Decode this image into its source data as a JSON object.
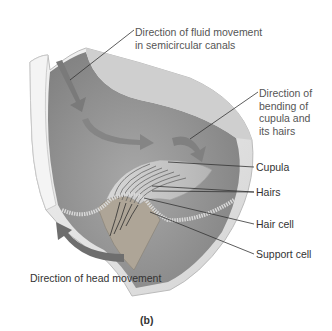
{
  "figure": {
    "subfigure_label": "(b)",
    "colors": {
      "canal_wall": "#e4e4e4",
      "canal_inner": "#8e8e8e",
      "arrow": "#7a7a7a",
      "head_arrow": "#6e6e6e",
      "cupula": "#c8c8c8",
      "support_tissue": "#b0a89a",
      "label_text": "#555555",
      "leader_line": "#333333"
    },
    "labels": {
      "fluid_movement": [
        "Direction of fluid movement",
        "in semicircular canals"
      ],
      "bending": [
        "Direction of",
        "bending of",
        "cupula and",
        "its hairs"
      ],
      "cupula": "Cupula",
      "hairs": "Hairs",
      "hair_cell": "Hair cell",
      "support_cell": "Support cell",
      "head_movement": "Direction of head movement"
    }
  }
}
